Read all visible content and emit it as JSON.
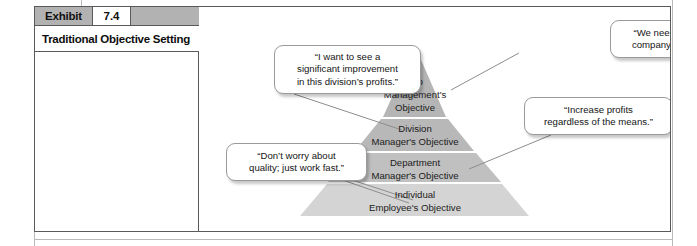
{
  "exhibit": {
    "label": "Exhibit",
    "number": "7.4",
    "title": "Traditional Objective Setting"
  },
  "figure": {
    "pyramid": {
      "levels": [
        {
          "id": "top-management",
          "lines": [
            "Top",
            "Management's",
            "Objective"
          ],
          "fill": "#b5b5b5"
        },
        {
          "id": "division-manager",
          "lines": [
            "Division",
            "Manager's Objective"
          ],
          "fill": "#b8b8b8"
        },
        {
          "id": "department-manager",
          "lines": [
            "Department",
            "Manager's Objective"
          ],
          "fill": "#c0c0c0"
        },
        {
          "id": "individual-employee",
          "lines": [
            "Individual",
            "Employee's Objective"
          ],
          "fill": "#d4d4d4"
        }
      ]
    },
    "callouts": [
      {
        "id": "top-management",
        "text": "“We need to improve the\ncompany’s performance.”"
      },
      {
        "id": "division-manager",
        "text": "“I want to see a\nsignificant improvement\nin this division’s profits.”"
      },
      {
        "id": "department-manager",
        "text": "“Increase profits\nregardless of the means.”"
      },
      {
        "id": "individual-employee",
        "text": "“Don’t worry about\nquality; just work fast.”"
      }
    ]
  },
  "colors": {
    "frame_border": "#5a5a5a",
    "header_gray": "#b2b2b2",
    "page_rule": "#b9b9b9",
    "leader_line": "#8d8d8d"
  }
}
